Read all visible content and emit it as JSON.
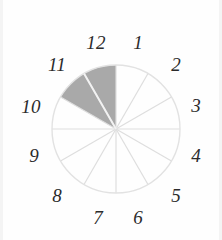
{
  "figure": {
    "background_color": "#fefefe",
    "width": 222,
    "height": 240
  },
  "clock": {
    "center_x": 116,
    "center_y": 129,
    "radius": 64,
    "sector_count": 12,
    "outline_color": "#e2e2e2",
    "spoke_color": "#dedede",
    "shaded_fill_color": "#a9a9a9",
    "shaded_divider_color": "#f2f2f2",
    "unshaded_fill_color": "#ffffff",
    "label_color": "#2b2b2b"
  },
  "hour_labels": [
    {
      "text": "1",
      "x": 138,
      "y": 42
    },
    {
      "text": "2",
      "x": 176,
      "y": 64
    },
    {
      "text": "3",
      "x": 196,
      "y": 105
    },
    {
      "text": "4",
      "x": 196,
      "y": 155
    },
    {
      "text": "5",
      "x": 176,
      "y": 195
    },
    {
      "text": "6",
      "x": 138,
      "y": 217
    },
    {
      "text": "7",
      "x": 98,
      "y": 217
    },
    {
      "text": "8",
      "x": 57,
      "y": 195
    },
    {
      "text": "9",
      "x": 34,
      "y": 155
    },
    {
      "text": "10",
      "x": 31,
      "y": 106
    },
    {
      "text": "11",
      "x": 57,
      "y": 64
    },
    {
      "text": "12",
      "x": 96,
      "y": 42
    }
  ],
  "chart_data": {
    "type": "pie",
    "categories": [
      "12→1",
      "1→2",
      "2→3",
      "3→4",
      "4→5",
      "5→6",
      "6→7",
      "7→8",
      "8→9",
      "9→10",
      "10→11",
      "11→12"
    ],
    "values": [
      1,
      1,
      1,
      1,
      1,
      1,
      1,
      1,
      1,
      1,
      1,
      1
    ],
    "slice_degrees": 30,
    "shaded_slices": [
      "10→11",
      "11→12"
    ],
    "shaded_count": 2,
    "shaded_fraction": "2/12",
    "shaded_start_hour": 10,
    "shaded_end_hour": 12,
    "shaded_start_angle_deg": 300,
    "shaded_end_angle_deg": 360,
    "colors": {
      "shaded": "#a9a9a9",
      "unshaded": "#ffffff",
      "outline": "#e2e2e2",
      "spoke": "#dedede"
    },
    "legend": "none",
    "grid": false,
    "xlabel": "",
    "ylabel": ""
  }
}
